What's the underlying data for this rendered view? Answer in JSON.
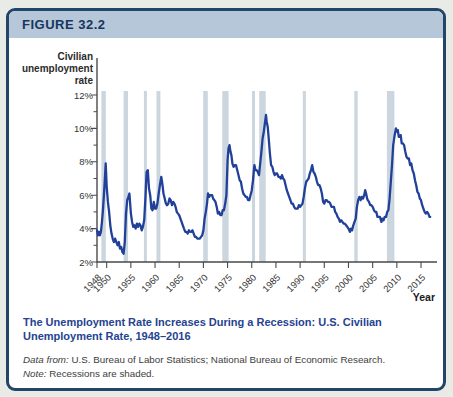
{
  "header": {
    "figure_label": "FIGURE 32.2"
  },
  "caption": {
    "title": "The Unemployment Rate Increases During a Recession: U.S. Civilian Unemployment Rate, 1948–2016"
  },
  "source": {
    "prefix": "Data from: ",
    "text": "U.S. Bureau of Labor Statistics; National Bureau of Economic Research."
  },
  "note": {
    "prefix": "Note: ",
    "text": "Recessions are shaded."
  },
  "colors": {
    "page_bg": "#e9ebe7",
    "card_bg": "#ffffff",
    "card_border": "#234668",
    "banner_bg": "#b5c7d8",
    "banner_text": "#17355e",
    "caption_blue": "#254390",
    "line_blue": "#21409a",
    "recession_band": "#ccd6df",
    "axis": "#4a4a4a",
    "tick_text": "#333333",
    "axis_title_text": "#2b2b2b"
  },
  "chart_data": {
    "type": "line",
    "title": "",
    "ylabel_lines": [
      "Civilian",
      "unemployment",
      "rate"
    ],
    "xlabel": "Year",
    "ylim": [
      2,
      12
    ],
    "xlim": [
      1948,
      2018
    ],
    "yticks": [
      2,
      4,
      6,
      8,
      10,
      12
    ],
    "ytick_suffix": "%",
    "yticks_minor": [
      3,
      5,
      7,
      9,
      11
    ],
    "xticks": [
      1948,
      1950,
      1955,
      1960,
      1965,
      1970,
      1975,
      1980,
      1985,
      1990,
      1995,
      2000,
      2005,
      2010,
      2015
    ],
    "grid": false,
    "legend": "none",
    "recessions_shaded": [
      [
        1948.9,
        1949.8
      ],
      [
        1953.5,
        1954.4
      ],
      [
        1957.7,
        1958.3
      ],
      [
        1960.3,
        1961.1
      ],
      [
        1969.95,
        1970.9
      ],
      [
        1973.9,
        1975.2
      ],
      [
        1980.05,
        1980.55
      ],
      [
        1981.55,
        1982.9
      ],
      [
        1990.55,
        1991.2
      ],
      [
        2001.2,
        2001.9
      ],
      [
        2007.95,
        2009.5
      ]
    ],
    "series": [
      {
        "name": "U.S. civilian unemployment rate (%)",
        "points": [
          [
            1948.0,
            3.9
          ],
          [
            1948.2,
            3.6
          ],
          [
            1948.4,
            3.8
          ],
          [
            1948.6,
            3.6
          ],
          [
            1948.8,
            3.8
          ],
          [
            1949.0,
            4.3
          ],
          [
            1949.2,
            5.0
          ],
          [
            1949.4,
            5.9
          ],
          [
            1949.6,
            6.8
          ],
          [
            1949.8,
            7.9
          ],
          [
            1950.0,
            6.5
          ],
          [
            1950.25,
            5.6
          ],
          [
            1950.5,
            5.0
          ],
          [
            1950.75,
            4.2
          ],
          [
            1951.0,
            3.7
          ],
          [
            1951.25,
            3.4
          ],
          [
            1951.5,
            3.2
          ],
          [
            1951.75,
            3.4
          ],
          [
            1952.0,
            3.2
          ],
          [
            1952.25,
            3.0
          ],
          [
            1952.5,
            3.2
          ],
          [
            1952.75,
            2.8
          ],
          [
            1953.0,
            2.9
          ],
          [
            1953.25,
            2.6
          ],
          [
            1953.5,
            2.5
          ],
          [
            1953.75,
            3.2
          ],
          [
            1954.0,
            4.9
          ],
          [
            1954.25,
            5.7
          ],
          [
            1954.5,
            5.9
          ],
          [
            1954.7,
            6.1
          ],
          [
            1955.0,
            4.9
          ],
          [
            1955.25,
            4.4
          ],
          [
            1955.5,
            4.1
          ],
          [
            1955.75,
            4.2
          ],
          [
            1956.0,
            4.0
          ],
          [
            1956.25,
            4.3
          ],
          [
            1956.5,
            4.1
          ],
          [
            1956.75,
            4.3
          ],
          [
            1957.0,
            4.2
          ],
          [
            1957.25,
            3.9
          ],
          [
            1957.5,
            4.1
          ],
          [
            1957.75,
            4.5
          ],
          [
            1958.0,
            5.8
          ],
          [
            1958.25,
            7.4
          ],
          [
            1958.5,
            7.5
          ],
          [
            1958.75,
            6.4
          ],
          [
            1959.0,
            6.0
          ],
          [
            1959.25,
            5.2
          ],
          [
            1959.5,
            5.1
          ],
          [
            1959.75,
            5.6
          ],
          [
            1960.0,
            5.2
          ],
          [
            1960.25,
            5.2
          ],
          [
            1960.5,
            5.5
          ],
          [
            1960.75,
            6.1
          ],
          [
            1961.0,
            6.6
          ],
          [
            1961.3,
            7.1
          ],
          [
            1961.5,
            6.7
          ],
          [
            1961.75,
            6.1
          ],
          [
            1962.0,
            5.8
          ],
          [
            1962.25,
            5.5
          ],
          [
            1962.5,
            5.4
          ],
          [
            1962.75,
            5.5
          ],
          [
            1963.0,
            5.8
          ],
          [
            1963.25,
            5.7
          ],
          [
            1963.5,
            5.4
          ],
          [
            1963.75,
            5.6
          ],
          [
            1964.0,
            5.5
          ],
          [
            1964.25,
            5.3
          ],
          [
            1964.5,
            5.0
          ],
          [
            1964.75,
            4.9
          ],
          [
            1965.0,
            4.8
          ],
          [
            1965.25,
            4.6
          ],
          [
            1965.5,
            4.4
          ],
          [
            1965.75,
            4.2
          ],
          [
            1966.0,
            4.0
          ],
          [
            1966.25,
            3.8
          ],
          [
            1966.5,
            3.8
          ],
          [
            1966.75,
            3.7
          ],
          [
            1967.0,
            3.9
          ],
          [
            1967.25,
            3.8
          ],
          [
            1967.5,
            3.8
          ],
          [
            1967.75,
            3.9
          ],
          [
            1968.0,
            3.7
          ],
          [
            1968.25,
            3.5
          ],
          [
            1968.5,
            3.5
          ],
          [
            1968.75,
            3.4
          ],
          [
            1969.0,
            3.4
          ],
          [
            1969.25,
            3.4
          ],
          [
            1969.5,
            3.5
          ],
          [
            1969.75,
            3.6
          ],
          [
            1970.0,
            3.9
          ],
          [
            1970.25,
            4.6
          ],
          [
            1970.5,
            5.0
          ],
          [
            1970.75,
            5.5
          ],
          [
            1970.95,
            6.1
          ],
          [
            1971.2,
            5.9
          ],
          [
            1971.4,
            6.0
          ],
          [
            1971.6,
            6.0
          ],
          [
            1971.8,
            6.0
          ],
          [
            1972.0,
            5.8
          ],
          [
            1972.25,
            5.7
          ],
          [
            1972.5,
            5.6
          ],
          [
            1972.75,
            5.3
          ],
          [
            1973.0,
            4.9
          ],
          [
            1973.25,
            5.0
          ],
          [
            1973.5,
            4.8
          ],
          [
            1973.75,
            4.8
          ],
          [
            1974.0,
            5.1
          ],
          [
            1974.25,
            5.1
          ],
          [
            1974.5,
            5.5
          ],
          [
            1974.75,
            6.0
          ],
          [
            1975.0,
            8.1
          ],
          [
            1975.2,
            8.8
          ],
          [
            1975.4,
            9.0
          ],
          [
            1975.6,
            8.6
          ],
          [
            1975.8,
            8.4
          ],
          [
            1976.0,
            7.9
          ],
          [
            1976.25,
            7.7
          ],
          [
            1976.5,
            7.8
          ],
          [
            1976.75,
            7.8
          ],
          [
            1977.0,
            7.5
          ],
          [
            1977.25,
            7.2
          ],
          [
            1977.5,
            6.9
          ],
          [
            1977.75,
            6.8
          ],
          [
            1978.0,
            6.4
          ],
          [
            1978.25,
            6.1
          ],
          [
            1978.5,
            6.0
          ],
          [
            1978.75,
            5.9
          ],
          [
            1979.0,
            5.9
          ],
          [
            1979.25,
            5.7
          ],
          [
            1979.5,
            5.7
          ],
          [
            1979.75,
            6.0
          ],
          [
            1980.0,
            6.3
          ],
          [
            1980.25,
            6.9
          ],
          [
            1980.55,
            7.8
          ],
          [
            1980.75,
            7.5
          ],
          [
            1981.0,
            7.5
          ],
          [
            1981.25,
            7.4
          ],
          [
            1981.5,
            7.2
          ],
          [
            1981.75,
            7.9
          ],
          [
            1982.0,
            8.6
          ],
          [
            1982.25,
            9.4
          ],
          [
            1982.5,
            9.8
          ],
          [
            1982.75,
            10.4
          ],
          [
            1982.95,
            10.8
          ],
          [
            1983.1,
            10.4
          ],
          [
            1983.3,
            10.1
          ],
          [
            1983.5,
            9.4
          ],
          [
            1983.75,
            8.5
          ],
          [
            1984.0,
            7.8
          ],
          [
            1984.25,
            7.7
          ],
          [
            1984.5,
            7.4
          ],
          [
            1984.75,
            7.2
          ],
          [
            1985.0,
            7.3
          ],
          [
            1985.25,
            7.3
          ],
          [
            1985.5,
            7.1
          ],
          [
            1985.75,
            7.1
          ],
          [
            1986.0,
            7.0
          ],
          [
            1986.25,
            7.2
          ],
          [
            1986.5,
            7.0
          ],
          [
            1986.75,
            6.9
          ],
          [
            1987.0,
            6.6
          ],
          [
            1987.25,
            6.3
          ],
          [
            1987.5,
            6.1
          ],
          [
            1987.75,
            5.9
          ],
          [
            1988.0,
            5.7
          ],
          [
            1988.25,
            5.5
          ],
          [
            1988.5,
            5.5
          ],
          [
            1988.75,
            5.3
          ],
          [
            1989.0,
            5.2
          ],
          [
            1989.25,
            5.2
          ],
          [
            1989.5,
            5.2
          ],
          [
            1989.75,
            5.4
          ],
          [
            1990.0,
            5.3
          ],
          [
            1990.25,
            5.4
          ],
          [
            1990.5,
            5.5
          ],
          [
            1990.75,
            5.9
          ],
          [
            1991.0,
            6.4
          ],
          [
            1991.25,
            6.8
          ],
          [
            1991.5,
            6.9
          ],
          [
            1991.75,
            7.0
          ],
          [
            1992.0,
            7.3
          ],
          [
            1992.25,
            7.5
          ],
          [
            1992.5,
            7.8
          ],
          [
            1992.75,
            7.4
          ],
          [
            1993.0,
            7.3
          ],
          [
            1993.25,
            7.1
          ],
          [
            1993.5,
            6.8
          ],
          [
            1993.75,
            6.6
          ],
          [
            1994.0,
            6.6
          ],
          [
            1994.25,
            6.4
          ],
          [
            1994.5,
            6.1
          ],
          [
            1994.75,
            5.6
          ],
          [
            1995.0,
            5.5
          ],
          [
            1995.25,
            5.7
          ],
          [
            1995.5,
            5.7
          ],
          [
            1995.75,
            5.6
          ],
          [
            1996.0,
            5.6
          ],
          [
            1996.25,
            5.5
          ],
          [
            1996.5,
            5.3
          ],
          [
            1996.75,
            5.3
          ],
          [
            1997.0,
            5.3
          ],
          [
            1997.25,
            5.0
          ],
          [
            1997.5,
            4.9
          ],
          [
            1997.75,
            4.7
          ],
          [
            1998.0,
            4.6
          ],
          [
            1998.25,
            4.4
          ],
          [
            1998.5,
            4.5
          ],
          [
            1998.75,
            4.4
          ],
          [
            1999.0,
            4.3
          ],
          [
            1999.25,
            4.3
          ],
          [
            1999.5,
            4.2
          ],
          [
            1999.75,
            4.1
          ],
          [
            2000.0,
            4.0
          ],
          [
            2000.3,
            3.8
          ],
          [
            2000.5,
            4.0
          ],
          [
            2000.75,
            3.9
          ],
          [
            2001.0,
            4.2
          ],
          [
            2001.25,
            4.4
          ],
          [
            2001.5,
            4.6
          ],
          [
            2001.75,
            5.3
          ],
          [
            2002.0,
            5.7
          ],
          [
            2002.25,
            5.9
          ],
          [
            2002.5,
            5.7
          ],
          [
            2002.75,
            5.9
          ],
          [
            2003.0,
            5.8
          ],
          [
            2003.25,
            6.0
          ],
          [
            2003.45,
            6.3
          ],
          [
            2003.65,
            6.1
          ],
          [
            2003.85,
            5.8
          ],
          [
            2004.0,
            5.7
          ],
          [
            2004.25,
            5.6
          ],
          [
            2004.5,
            5.4
          ],
          [
            2004.75,
            5.4
          ],
          [
            2005.0,
            5.3
          ],
          [
            2005.25,
            5.1
          ],
          [
            2005.5,
            5.0
          ],
          [
            2005.75,
            5.0
          ],
          [
            2006.0,
            4.7
          ],
          [
            2006.25,
            4.7
          ],
          [
            2006.5,
            4.7
          ],
          [
            2006.8,
            4.4
          ],
          [
            2007.0,
            4.6
          ],
          [
            2007.25,
            4.5
          ],
          [
            2007.5,
            4.7
          ],
          [
            2007.75,
            4.7
          ],
          [
            2008.0,
            5.0
          ],
          [
            2008.25,
            5.1
          ],
          [
            2008.5,
            5.8
          ],
          [
            2008.75,
            6.8
          ],
          [
            2009.0,
            7.8
          ],
          [
            2009.25,
            9.0
          ],
          [
            2009.5,
            9.5
          ],
          [
            2009.8,
            10.0
          ],
          [
            2010.0,
            9.8
          ],
          [
            2010.2,
            9.9
          ],
          [
            2010.4,
            9.5
          ],
          [
            2010.6,
            9.5
          ],
          [
            2010.8,
            9.6
          ],
          [
            2011.0,
            9.1
          ],
          [
            2011.25,
            9.1
          ],
          [
            2011.5,
            9.0
          ],
          [
            2011.75,
            8.6
          ],
          [
            2012.0,
            8.3
          ],
          [
            2012.25,
            8.2
          ],
          [
            2012.5,
            8.2
          ],
          [
            2012.75,
            7.8
          ],
          [
            2013.0,
            7.9
          ],
          [
            2013.25,
            7.5
          ],
          [
            2013.5,
            7.3
          ],
          [
            2013.75,
            6.9
          ],
          [
            2014.0,
            6.6
          ],
          [
            2014.25,
            6.2
          ],
          [
            2014.5,
            6.1
          ],
          [
            2014.75,
            5.8
          ],
          [
            2015.0,
            5.7
          ],
          [
            2015.25,
            5.4
          ],
          [
            2015.5,
            5.2
          ],
          [
            2015.75,
            5.0
          ],
          [
            2016.0,
            4.9
          ],
          [
            2016.25,
            5.0
          ],
          [
            2016.5,
            4.9
          ],
          [
            2016.75,
            4.7
          ],
          [
            2016.9,
            4.7
          ]
        ]
      }
    ]
  }
}
